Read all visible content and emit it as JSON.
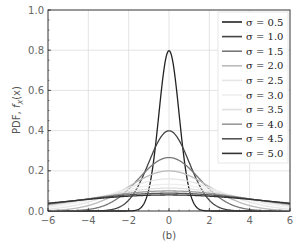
{
  "chart_data": {
    "type": "line",
    "title": "",
    "xlabel": "",
    "ylabel": "PDF, f_X(x)",
    "caption": "(b)",
    "xlim": [
      -6,
      6
    ],
    "ylim": [
      0,
      1.0
    ],
    "xticks": [
      -6,
      -4,
      -2,
      0,
      2,
      4,
      6
    ],
    "yticks": [
      0.0,
      0.2,
      0.4,
      0.6,
      0.8,
      1.0
    ],
    "grid": true,
    "legend_position": "upper right",
    "distribution": "normal, mean 0",
    "series": [
      {
        "name": "σ = 0.5",
        "sigma": 0.5,
        "color": "#222222",
        "peak": 0.798
      },
      {
        "name": "σ = 1.0",
        "sigma": 1.0,
        "color": "#444444",
        "peak": 0.399
      },
      {
        "name": "σ = 1.5",
        "sigma": 1.5,
        "color": "#777777",
        "peak": 0.266
      },
      {
        "name": "σ = 2.0",
        "sigma": 2.0,
        "color": "#bbbbbb",
        "peak": 0.199
      },
      {
        "name": "σ = 2.5",
        "sigma": 2.5,
        "color": "#e6e6e6",
        "peak": 0.16
      },
      {
        "name": "σ = 3.0",
        "sigma": 3.0,
        "color": "#eeeeee",
        "peak": 0.133
      },
      {
        "name": "σ = 3.5",
        "sigma": 3.5,
        "color": "#e0e0e0",
        "peak": 0.114
      },
      {
        "name": "σ = 4.0",
        "sigma": 4.0,
        "color": "#999999",
        "peak": 0.1
      },
      {
        "name": "σ = 4.5",
        "sigma": 4.5,
        "color": "#555555",
        "peak": 0.089
      },
      {
        "name": "σ = 5.0",
        "sigma": 5.0,
        "color": "#333333",
        "peak": 0.08
      }
    ]
  },
  "labels": {
    "ylabel_main": "PDF, ",
    "ylabel_func": "f",
    "ylabel_sub": "X",
    "ylabel_arg": "(x)",
    "caption": "(b)",
    "xticks": [
      "−6",
      "−4",
      "−2",
      "0",
      "2",
      "4",
      "6"
    ],
    "yticks": [
      "0.0",
      "0.2",
      "0.4",
      "0.6",
      "0.8",
      "1.0"
    ]
  }
}
